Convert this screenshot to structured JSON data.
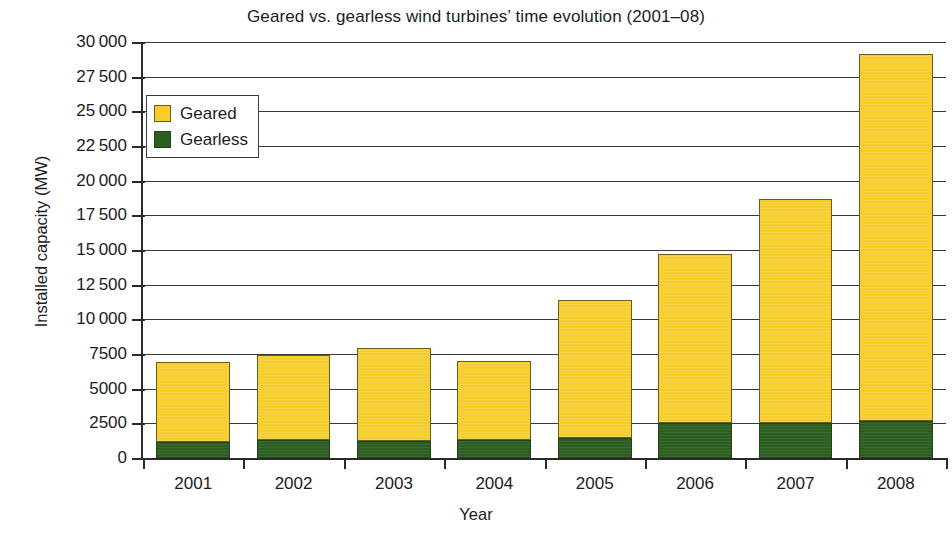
{
  "chart_data": {
    "type": "bar",
    "subtype": "stacked",
    "title": "Geared vs. gearless wind turbines’ time evolution (2001–08)",
    "xlabel": "Year",
    "ylabel": "Installed capacity (MW)",
    "categories": [
      "2001",
      "2002",
      "2003",
      "2004",
      "2005",
      "2006",
      "2007",
      "2008"
    ],
    "series": [
      {
        "name": "Gearless",
        "color": "#2b5e1f",
        "values": [
          1150,
          1300,
          1250,
          1300,
          1450,
          2500,
          2500,
          2650
        ]
      },
      {
        "name": "Geared",
        "color": "#f5ce2e",
        "values": [
          5750,
          6100,
          6650,
          5700,
          9950,
          12200,
          16200,
          26450
        ]
      }
    ],
    "totals": [
      6900,
      7400,
      7900,
      7000,
      11400,
      14700,
      18700,
      29100
    ],
    "ylim": [
      0,
      30000
    ],
    "ytick_values": [
      0,
      2500,
      5000,
      7500,
      10000,
      12500,
      15000,
      17500,
      20000,
      22500,
      25000,
      27500,
      30000
    ],
    "ytick_labels": [
      "0",
      "2500",
      "5000",
      "7500",
      "10 000",
      "12 500",
      "15 000",
      "17 500",
      "20 000",
      "22 500",
      "25 000",
      "27 500",
      "30 000"
    ],
    "grid": true,
    "grid_axis": "y",
    "legend": {
      "position": "upper-left-inside",
      "entries": [
        {
          "label": "Geared",
          "color": "#f5ce2e",
          "swatch": "geared-swatch-icon"
        },
        {
          "label": "Gearless",
          "color": "#2b5e1f",
          "swatch": "gearless-swatch-icon"
        }
      ]
    }
  }
}
